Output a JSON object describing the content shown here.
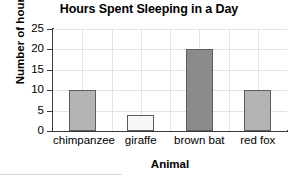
{
  "chart_data": {
    "type": "bar",
    "title": "Hours Spent Sleeping in a Day",
    "xlabel": "Animal",
    "ylabel": "Number of hours",
    "categories": [
      "chimpanzee",
      "giraffe",
      "brown bat",
      "red fox"
    ],
    "values": [
      10,
      4,
      20,
      10
    ],
    "ylim": [
      0,
      25
    ],
    "yticks": [
      0,
      5,
      10,
      15,
      20,
      25
    ],
    "ytick_labels": [
      "0",
      "5",
      "10",
      "15",
      "20",
      "25"
    ],
    "grid": true,
    "legend": false,
    "bar_colors": [
      "#b4b4b4",
      "#f6f6f6",
      "#8b8b8b",
      "#b4b4b4"
    ],
    "bar_edge_color": "#5d5d5d",
    "axis_color": "#3a3a3a",
    "grid_color": "#e2e2e2",
    "background": "#ffffff"
  }
}
